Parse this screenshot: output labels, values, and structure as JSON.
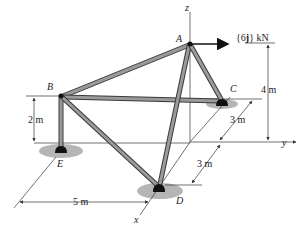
{
  "labels": {
    "A": "A",
    "B": "B",
    "C": "C",
    "D": "D",
    "E": "E",
    "x": "x",
    "y": "y",
    "z": "z"
  },
  "force": {
    "prefix": "{6",
    "vec": "j",
    "suffix": "} kN"
  },
  "dimensions": {
    "height_A": "4 m",
    "height_B": "2 m",
    "dist_C": "3 m",
    "dist_D": "3 m",
    "dist_ED": "5 m"
  },
  "colors": {
    "member": "#8c8c8c",
    "member_edge": "#3a3a3a",
    "ground": "#a8a8a8",
    "joint": "#111111",
    "line": "#333333"
  }
}
